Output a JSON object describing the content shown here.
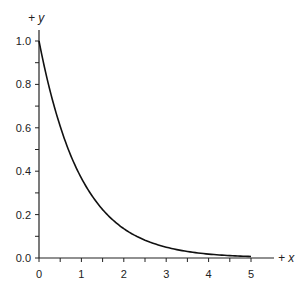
{
  "chart_data": {
    "type": "line",
    "title": "",
    "xlabel": "+ x",
    "ylabel": "+ y",
    "xlim": [
      0,
      5
    ],
    "ylim": [
      0,
      1.0
    ],
    "x_ticks": [
      "0",
      "1",
      "2",
      "3",
      "4",
      "5"
    ],
    "y_ticks": [
      "0.0",
      "0.2",
      "0.4",
      "0.6",
      "0.8",
      "1.0"
    ],
    "grid": false,
    "legend": null,
    "series": [
      {
        "name": "y = e^(-x)",
        "x": [
          0,
          0.25,
          0.5,
          0.75,
          1,
          1.25,
          1.5,
          1.75,
          2,
          2.5,
          3,
          3.5,
          4,
          4.5,
          5
        ],
        "values": [
          1.0,
          0.779,
          0.607,
          0.472,
          0.368,
          0.287,
          0.223,
          0.174,
          0.135,
          0.082,
          0.05,
          0.03,
          0.018,
          0.011,
          0.007
        ]
      }
    ]
  },
  "colors": {
    "axis": "#222222",
    "curve": "#111111",
    "background": "#ffffff"
  }
}
